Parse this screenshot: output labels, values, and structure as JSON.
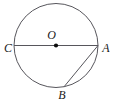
{
  "figure": {
    "kind": "circle-geometry-diagram",
    "background_color": "#ffffff",
    "stroke_color": "#57565c",
    "label_color": "#1a1a1a",
    "point_color": "#0d0d0d",
    "width": 115,
    "height": 102,
    "circle": {
      "center_x": 56,
      "center_y": 45.5,
      "radius": 42
    },
    "center_point": {
      "label": "O",
      "x": 56,
      "y": 45.5,
      "dot_radius": 2.1,
      "label_x": 51.5,
      "label_y": 39
    },
    "points": [
      {
        "label": "C",
        "x": 14,
        "y": 45.5,
        "label_x": 8,
        "label_y": 52
      },
      {
        "label": "A",
        "x": 98,
        "y": 45.5,
        "label_x": 106,
        "label_y": 52
      },
      {
        "label": "B",
        "x": 64,
        "y": 86.8,
        "label_x": 62,
        "label_y": 99
      }
    ],
    "segments": [
      {
        "name": "diameter-CA",
        "from": "C",
        "to": "A",
        "x1": 14,
        "y1": 45.5,
        "x2": 98,
        "y2": 45.5
      },
      {
        "name": "chord-AB",
        "from": "A",
        "to": "B",
        "x1": 98,
        "y1": 45.5,
        "x2": 64,
        "y2": 86.8
      }
    ]
  }
}
